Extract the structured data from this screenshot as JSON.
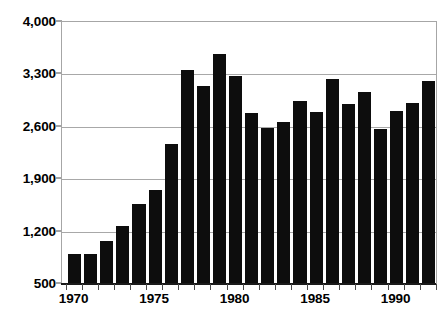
{
  "chart_data": {
    "type": "bar",
    "title": "",
    "xlabel": "",
    "ylabel": "",
    "ylim": [
      500,
      4000
    ],
    "y_ticks": [
      500,
      1200,
      1900,
      2600,
      3300,
      4000
    ],
    "y_tick_labels": [
      "500",
      "1,200",
      "1,900",
      "2,600",
      "3,300",
      "4,000"
    ],
    "grid": true,
    "legend": null,
    "bar_color": "#0d0d0d",
    "grid_color": "#a8a8a8",
    "axis_color": "#1a1a1a",
    "x_tick_labels": [
      "1970",
      "1975",
      "1980",
      "1985",
      "1990"
    ],
    "x_labeled_categories": [
      1970,
      1975,
      1980,
      1985,
      1990
    ],
    "categories": [
      "1970",
      "1971",
      "1972",
      "1973",
      "1974",
      "1975",
      "1976",
      "1977",
      "1978",
      "1979",
      "1980",
      "1981",
      "1982",
      "1983",
      "1984",
      "1985",
      "1986",
      "1987",
      "1988",
      "1989",
      "1990",
      "1991",
      "1992"
    ],
    "values": [
      900,
      900,
      1070,
      1280,
      1570,
      1760,
      2370,
      3360,
      3140,
      3570,
      3280,
      2790,
      2590,
      2670,
      2950,
      2800,
      3240,
      2910,
      3060,
      2570,
      2810,
      2920,
      3210
    ]
  },
  "figure": {
    "title_remnant": ""
  }
}
